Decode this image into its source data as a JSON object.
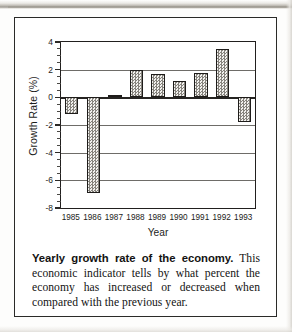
{
  "figure": {
    "caption_lead": "Yearly growth rate of the economy.",
    "caption_body": " This economic indicator tells by what percent the economy has increased or decreased when compared with the previous year."
  },
  "chart_data": {
    "type": "bar",
    "title": "",
    "xlabel": "Year",
    "ylabel": "Growth Rate (%)",
    "categories": [
      "1985",
      "1986",
      "1987",
      "1988",
      "1989",
      "1990",
      "1991",
      "1992",
      "1993"
    ],
    "values": [
      -1.2,
      -6.9,
      0.2,
      2.0,
      1.7,
      1.2,
      1.75,
      3.5,
      -1.8
    ],
    "ylim": [
      -8,
      4
    ],
    "ytick_labels": [
      "4",
      "2",
      "0",
      "-2",
      "-4",
      "-6",
      "-8"
    ],
    "ytick_values": [
      4,
      2,
      0,
      -2,
      -4,
      -6,
      -8
    ],
    "yminor_step": 0.5,
    "grid": true,
    "legend": "none",
    "bar_fill": "dither-gray-checker",
    "colors": {
      "axis": "#211f1e",
      "grid": "#6e6c68",
      "bar_fill": "#d3d2cf",
      "bar_edge": "#1e1c1a",
      "text": "#1b1b19",
      "frame": "#2a2a28"
    }
  }
}
